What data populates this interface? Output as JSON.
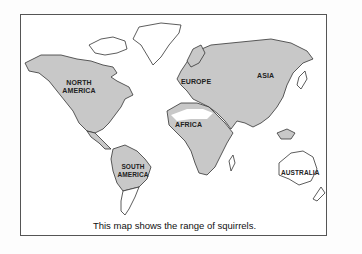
{
  "map": {
    "caption": "This map shows the range of squirrels.",
    "fill_color": "#c8c8c8",
    "outline_color": "#333333",
    "labels": {
      "north_america": [
        "NORTH",
        "AMERICA"
      ],
      "south_america": [
        "SOUTH",
        "AMERICA"
      ],
      "europe": "EUROPE",
      "asia": "ASIA",
      "africa": "AFRICA",
      "australia": "AUSTRALIA"
    },
    "range_regions": [
      "North America",
      "Central and northern South America",
      "Europe",
      "Asia (excluding far north)",
      "Africa (excluding Sahara)",
      "Southeast Asian islands"
    ],
    "non_range_regions": [
      "Greenland",
      "Arctic islands",
      "Southern South America",
      "Sahara",
      "Australia",
      "New Zealand"
    ]
  }
}
